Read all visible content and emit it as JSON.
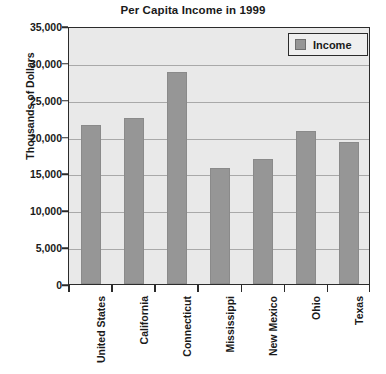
{
  "chart_data": {
    "type": "bar",
    "title": "Per Capita Income in 1999",
    "xlabel": "",
    "ylabel": "Thousands of Dollars",
    "categories": [
      "United States",
      "California",
      "Connecticut",
      "Mississippi",
      "New Mexico",
      "Ohio",
      "Texas"
    ],
    "series": [
      {
        "name": "Income",
        "values": [
          21600,
          22500,
          28800,
          15800,
          17000,
          20800,
          19200
        ]
      }
    ],
    "values": [
      21600,
      22500,
      28800,
      15800,
      17000,
      20800,
      19200
    ],
    "ylim": [
      0,
      35000
    ],
    "ytick_values": [
      0,
      5000,
      10000,
      15000,
      20000,
      25000,
      30000,
      35000
    ],
    "ytick_labels": [
      "0",
      "5,000",
      "10,000",
      "15,000",
      "20,000",
      "25,000",
      "30,000",
      "35,000"
    ],
    "grid": true,
    "legend_position": "top-right",
    "legend_entries": [
      "Income"
    ],
    "colors": {
      "bar_fill": "#969696",
      "bar_edge": "#8a8a8a",
      "plot_background": "#e9e9e9",
      "figure_background": "#ffffff",
      "axis": "#2b2b2b",
      "gridline": "#a9a9a9",
      "text": "#1a1a1a",
      "legend_background": "#efefef"
    }
  }
}
